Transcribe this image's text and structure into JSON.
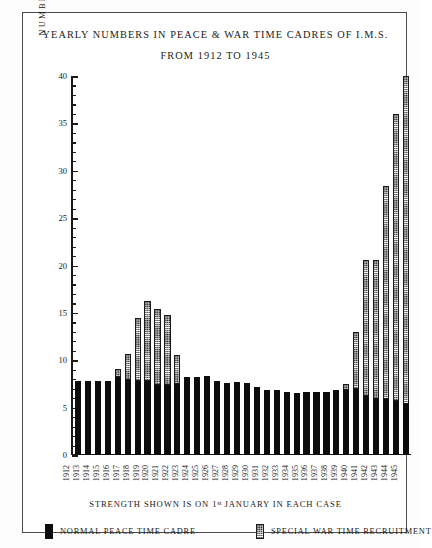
{
  "figure": {
    "title_line_1": "YEARLY NUMBERS IN PEACE & WAR TIME CADRES OF I.M.S.",
    "title_line_2": "FROM 1912 TO 1945",
    "x_caption_before": "STRENGTH SHOWN IS ON 1",
    "x_caption_sup": "st",
    "x_caption_after": " JANUARY IN EACH CASE",
    "border_color": "#4a4a4a",
    "ink_color": "#0d0d0d",
    "background": "#ffffff"
  },
  "legend": {
    "items": [
      {
        "label": "NORMAL PEACE TIME CADRE",
        "swatch": "solid-black"
      },
      {
        "label": "SPECIAL WAR TIME RECRUITMENT",
        "swatch": "hatched"
      }
    ]
  },
  "chart_data": {
    "type": "bar",
    "title": "YEARLY NUMBERS IN PEACE & WAR TIME CADRES OF I.M.S. FROM 1912 TO 1945",
    "subtitle": "STRENGTH SHOWN IS ON 1st JANUARY IN EACH CASE",
    "stacked": true,
    "xlabel": "",
    "ylabel": "NUMBERS IN HUNDREDS",
    "ylim": [
      0,
      40
    ],
    "ytick_step": 5,
    "yticks": [
      0,
      5,
      10,
      15,
      20,
      25,
      30,
      35,
      40
    ],
    "ytick_labels": [
      "0",
      "5",
      "10",
      "15",
      "20",
      "25",
      "30",
      "35",
      "40"
    ],
    "grid": false,
    "legend_position": "bottom",
    "categories": [
      "1912",
      "1913",
      "1914",
      "1915",
      "1916",
      "1917",
      "1918",
      "1919",
      "1920",
      "1921",
      "1922",
      "1923",
      "1924",
      "1925",
      "1926",
      "1927",
      "1928",
      "1929",
      "1930",
      "1931",
      "1932",
      "1933",
      "1934",
      "1935",
      "1936",
      "1937",
      "1938",
      "1939",
      "1940",
      "1941",
      "1942",
      "1943",
      "1944",
      "1945"
    ],
    "series": [
      {
        "name": "NORMAL PEACE TIME CADRE",
        "color": "#0d0d0d",
        "values": [
          7.8,
          7.8,
          7.8,
          7.8,
          8.2,
          7.9,
          7.8,
          7.8,
          7.4,
          7.4,
          7.5,
          8.2,
          8.2,
          8.3,
          7.8,
          7.6,
          7.7,
          7.6,
          7.2,
          6.9,
          6.9,
          6.7,
          6.5,
          6.6,
          6.6,
          6.6,
          6.9,
          6.9,
          7.0,
          6.2,
          5.9,
          5.9,
          5.7,
          5.4
        ]
      },
      {
        "name": "SPECIAL WAR TIME RECRUITMENT",
        "color": "#ffffff",
        "pattern": "hatched",
        "values": [
          0,
          0,
          0,
          0,
          0.9,
          2.8,
          6.7,
          8.5,
          8.0,
          7.4,
          3.1,
          0,
          0,
          0,
          0,
          0,
          0,
          0,
          0,
          0,
          0,
          0,
          0,
          0,
          0,
          0,
          0,
          0.6,
          6.0,
          14.4,
          14.7,
          22.5,
          30.3,
          34.6
        ]
      }
    ],
    "totals": [
      7.8,
      7.8,
      7.8,
      7.8,
      9.1,
      10.7,
      14.5,
      16.3,
      15.4,
      14.8,
      10.6,
      8.2,
      8.2,
      8.3,
      7.8,
      7.6,
      7.7,
      7.6,
      7.2,
      6.9,
      6.9,
      6.7,
      6.5,
      6.6,
      6.6,
      6.6,
      6.9,
      7.5,
      13.0,
      20.6,
      20.6,
      28.4,
      36.0,
      40.0
    ]
  }
}
